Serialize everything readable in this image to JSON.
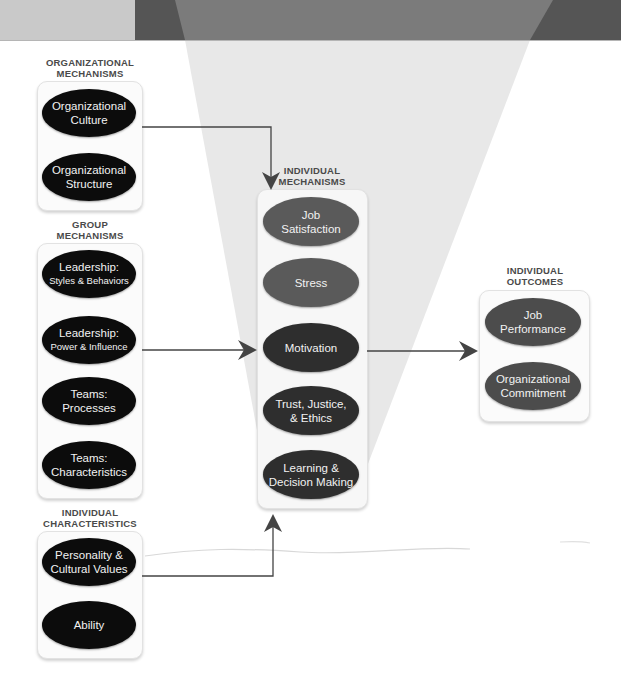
{
  "colors": {
    "banner_light": "#c9c9c9",
    "banner_dark": "#555555",
    "spotlight_top": "#7b7b7b",
    "spotlight_body": "#e6e6e6",
    "oval_black": "#0c0c0c",
    "oval_dark": "#2e2e2e",
    "oval_gray": "#5a5a5a",
    "arrow": "#444444"
  },
  "organizational_mechanisms": {
    "title_line1": "ORGANIZATIONAL",
    "title_line2": "MECHANISMS",
    "items": [
      {
        "line1": "Organizational",
        "line2": "Culture"
      },
      {
        "line1": "Organizational",
        "line2": "Structure"
      }
    ]
  },
  "group_mechanisms": {
    "title_line1": "GROUP",
    "title_line2": "MECHANISMS",
    "items": [
      {
        "line1": "Leadership:",
        "line2": "Styles & Behaviors"
      },
      {
        "line1": "Leadership:",
        "line2": "Power & Influence"
      },
      {
        "line1": "Teams:",
        "line2": "Processes"
      },
      {
        "line1": "Teams:",
        "line2": "Characteristics"
      }
    ]
  },
  "individual_characteristics": {
    "title_line1": "INDIVIDUAL",
    "title_line2": "CHARACTERISTICS",
    "items": [
      {
        "line1": "Personality  &",
        "line2": "Cultural Values"
      },
      {
        "line1": "Ability",
        "line2": ""
      }
    ]
  },
  "individual_mechanisms": {
    "title_line1": "INDIVIDUAL",
    "title_line2": "MECHANISMS",
    "items": [
      {
        "line1": "Job",
        "line2": "Satisfaction"
      },
      {
        "line1": "Stress",
        "line2": ""
      },
      {
        "line1": "Motivation",
        "line2": ""
      },
      {
        "line1": "Trust, Justice,",
        "line2": "& Ethics"
      },
      {
        "line1": "Learning &",
        "line2": "Decision Making"
      }
    ]
  },
  "individual_outcomes": {
    "title_line1": "INDIVIDUAL",
    "title_line2": "OUTCOMES",
    "items": [
      {
        "line1": "Job",
        "line2": "Performance"
      },
      {
        "line1": "Organizational",
        "line2": "Commitment"
      }
    ]
  }
}
